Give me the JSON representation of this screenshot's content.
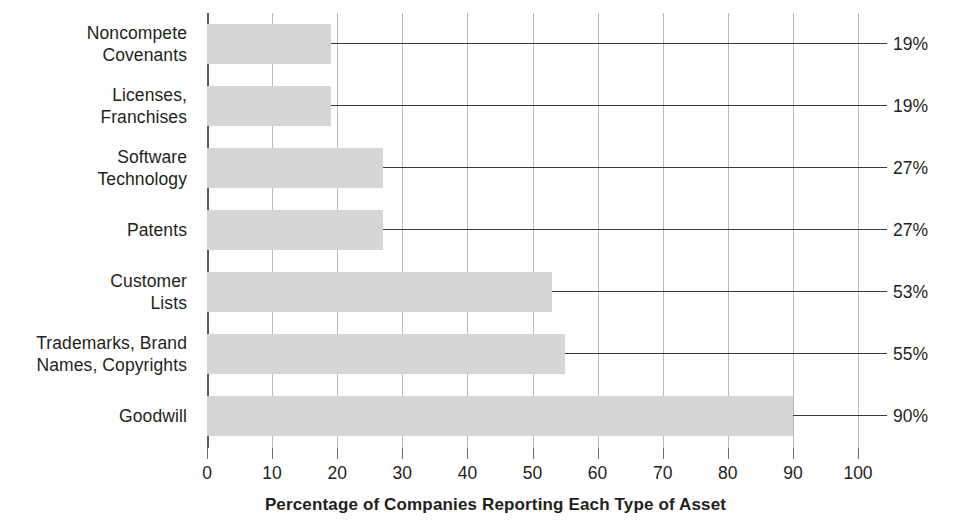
{
  "chart_data": {
    "type": "bar",
    "orientation": "horizontal",
    "title": "",
    "xlabel": "Percentage of Companies Reporting Each Type of Asset",
    "ylabel": "",
    "xlim": [
      0,
      100
    ],
    "grid": true,
    "legend": null,
    "xticks": [
      "0",
      "10",
      "20",
      "30",
      "40",
      "50",
      "60",
      "70",
      "80",
      "90",
      "100"
    ],
    "xtick_values": [
      0,
      10,
      20,
      30,
      40,
      50,
      60,
      70,
      80,
      90,
      100
    ],
    "categories": [
      "Noncompete Covenants",
      "Licenses, Franchises",
      "Software Technology",
      "Patents",
      "Customer Lists",
      "Trademarks, Brand Names, Copyrights",
      "Goodwill"
    ],
    "category_lines": [
      [
        "Noncompete",
        "Covenants"
      ],
      [
        "Licenses,",
        "Franchises"
      ],
      [
        "Software",
        "Technology"
      ],
      [
        "Patents"
      ],
      [
        "Customer",
        "Lists"
      ],
      [
        "Trademarks, Brand",
        "Names, Copyrights"
      ],
      [
        "Goodwill"
      ]
    ],
    "values": [
      19,
      19,
      27,
      27,
      53,
      55,
      90
    ],
    "value_labels": [
      "19%",
      "19%",
      "27%",
      "27%",
      "53%",
      "55%",
      "90%"
    ],
    "bar_color": "#d6d6d6",
    "gridline_color": "#b9b9b9",
    "axis_color": "#58595b",
    "text_color": "#231f20",
    "leader_line_color": "#3a3a3a"
  }
}
